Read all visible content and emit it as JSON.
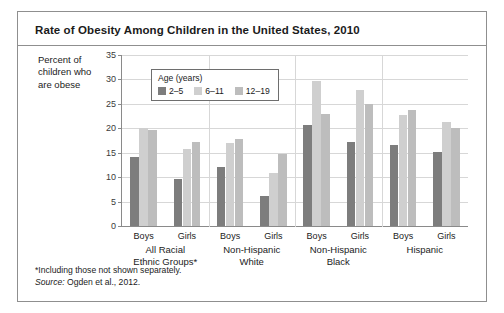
{
  "figure": {
    "title": "Rate of Obesity Among Children in the United States, 2010",
    "y_axis_caption": "Percent of children who are obese",
    "footnote": "*Including those not shown separately.",
    "source_prefix": "Source:",
    "source_text": " Ogden et al., 2012."
  },
  "legend": {
    "title": "Age (years)",
    "items": [
      {
        "label": "2–5",
        "color": "#7d7d7d"
      },
      {
        "label": "6–11",
        "color": "#cfcfcf"
      },
      {
        "label": "12–19",
        "color": "#bdbdbd"
      }
    ]
  },
  "chart_data": {
    "type": "bar",
    "title": "Rate of Obesity Among Children in the United States, 2010",
    "xlabel": "",
    "ylabel": "Percent of children who are obese",
    "ylim": [
      0,
      35
    ],
    "yticks": [
      0,
      5,
      10,
      15,
      20,
      25,
      30,
      35
    ],
    "ytick_labels": [
      "0",
      "5",
      "10",
      "15",
      "20",
      "25",
      "30",
      "35"
    ],
    "grid": true,
    "legend_position": "upper-left-inside",
    "groups": [
      {
        "label": "All Racial Ethnic Groups*",
        "label_lines": [
          "All Racial",
          "Ethnic Groups*"
        ]
      },
      {
        "label": "Non-Hispanic White",
        "label_lines": [
          "Non-Hispanic",
          "White"
        ]
      },
      {
        "label": "Non-Hispanic Black",
        "label_lines": [
          "Non-Hispanic",
          "Black"
        ]
      },
      {
        "label": "Hispanic",
        "label_lines": [
          "Hispanic"
        ]
      }
    ],
    "subcategories": [
      "Boys",
      "Girls"
    ],
    "categories": [
      "All Racial Ethnic Groups* - Boys",
      "All Racial Ethnic Groups* - Girls",
      "Non-Hispanic White - Boys",
      "Non-Hispanic White - Girls",
      "Non-Hispanic Black - Boys",
      "Non-Hispanic Black - Girls",
      "Hispanic - Boys",
      "Hispanic - Girls"
    ],
    "series": [
      {
        "name": "2–5",
        "color": "#7d7d7d",
        "values": [
          14.2,
          9.6,
          12.0,
          6.2,
          20.7,
          17.2,
          16.5,
          15.2
        ]
      },
      {
        "name": "6–11",
        "color": "#cfcfcf",
        "values": [
          20.0,
          15.7,
          17.0,
          10.8,
          29.6,
          27.9,
          22.8,
          21.3
        ]
      },
      {
        "name": "12–19",
        "color": "#bdbdbd",
        "values": [
          19.6,
          17.1,
          17.8,
          14.8,
          22.9,
          25.0,
          23.7,
          20.1
        ]
      }
    ]
  }
}
